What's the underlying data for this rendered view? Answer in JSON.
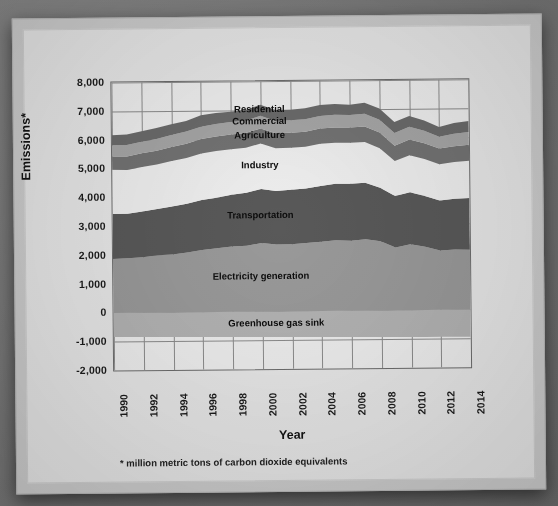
{
  "card": {
    "footnote": "* million metric tons of carbon dioxide equivalents"
  },
  "chart_data": {
    "type": "area",
    "title": "",
    "subtitle": "",
    "xlabel": "Year",
    "ylabel": "Emissions*",
    "stacked": true,
    "grid": true,
    "legend_position": "inline-labels",
    "xlim": [
      1990,
      2014
    ],
    "ylim": [
      -2000,
      8000
    ],
    "ytick_labels": [
      "8,000",
      "7,000",
      "6,000",
      "5,000",
      "4,000",
      "3,000",
      "2,000",
      "1,000",
      "0",
      "-1,000",
      "-2,000"
    ],
    "ytick_values": [
      8000,
      7000,
      6000,
      5000,
      4000,
      3000,
      2000,
      1000,
      0,
      -1000,
      -2000
    ],
    "xtick_labels": [
      "1990",
      "1992",
      "1994",
      "1996",
      "1998",
      "2000",
      "2002",
      "2004",
      "2006",
      "2008",
      "2010",
      "2012",
      "2014"
    ],
    "xtick_values": [
      1990,
      1992,
      1994,
      1996,
      1998,
      2000,
      2002,
      2004,
      2006,
      2008,
      2010,
      2012,
      2014
    ],
    "x": [
      1990,
      1991,
      1992,
      1993,
      1994,
      1995,
      1996,
      1997,
      1998,
      1999,
      2000,
      2001,
      2002,
      2003,
      2004,
      2005,
      2006,
      2007,
      2008,
      2009,
      2010,
      2011,
      2012,
      2013,
      2014
    ],
    "units": "million metric tons of carbon dioxide equivalents",
    "series": [
      {
        "name": "Greenhouse gas sink",
        "color": "#b4b4b4",
        "label_color": "#0d0d0d",
        "values": [
          -830,
          -840,
          -845,
          -850,
          -855,
          -860,
          -865,
          -870,
          -875,
          -880,
          -885,
          -890,
          -895,
          -900,
          -905,
          -910,
          -915,
          -918,
          -920,
          -925,
          -930,
          -935,
          -938,
          -940,
          -942
        ]
      },
      {
        "name": "Electricity generation",
        "color": "#9a9a9a",
        "label_color": "#0d0d0d",
        "values": [
          1875,
          1900,
          1930,
          1990,
          2015,
          2080,
          2160,
          2210,
          2270,
          2290,
          2380,
          2320,
          2330,
          2365,
          2400,
          2450,
          2430,
          2480,
          2400,
          2180,
          2290,
          2200,
          2060,
          2090,
          2080
        ]
      },
      {
        "name": "Transportation",
        "color": "#595959",
        "label_color": "#0d0d0d",
        "values": [
          1560,
          1540,
          1580,
          1610,
          1660,
          1690,
          1730,
          1760,
          1800,
          1840,
          1880,
          1860,
          1890,
          1890,
          1940,
          1960,
          1980,
          1960,
          1860,
          1790,
          1800,
          1760,
          1740,
          1760,
          1790
        ]
      },
      {
        "name": "Industry",
        "color": "#efefef",
        "label_color": "#0d0d0d",
        "values": [
          1540,
          1520,
          1550,
          1540,
          1580,
          1590,
          1620,
          1620,
          1580,
          1560,
          1580,
          1490,
          1460,
          1450,
          1470,
          1430,
          1420,
          1410,
          1370,
          1210,
          1290,
          1280,
          1260,
          1280,
          1300
        ]
      },
      {
        "name": "Agriculture",
        "color": "#737373",
        "label_color": "#0d0d0d",
        "values": [
          460,
          470,
          475,
          480,
          490,
          495,
          500,
          505,
          510,
          515,
          520,
          515,
          520,
          520,
          525,
          530,
          535,
          540,
          545,
          535,
          545,
          550,
          545,
          550,
          555
        ]
      },
      {
        "name": "Commercial",
        "color": "#a6a6a6",
        "label_color": "#0d0d0d",
        "values": [
          390,
          400,
          405,
          410,
          415,
          420,
          430,
          435,
          430,
          425,
          440,
          430,
          430,
          435,
          440,
          440,
          430,
          445,
          450,
          440,
          440,
          430,
          410,
          430,
          440
        ]
      },
      {
        "name": "Residential",
        "color": "#6b6b6b",
        "label_color": "#0d0d0d",
        "values": [
          345,
          360,
          360,
          375,
          370,
          370,
          395,
          380,
          360,
          370,
          380,
          375,
          370,
          385,
          375,
          370,
          355,
          380,
          390,
          380,
          380,
          360,
          335,
          370,
          385
        ]
      }
    ]
  }
}
